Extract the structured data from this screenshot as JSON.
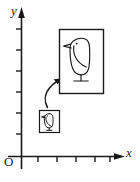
{
  "figure": {
    "background_color": "#ffffff",
    "stroke_color": "#1a1a1a"
  },
  "axes": {
    "y_axis_label": "y",
    "x_axis_label": "x",
    "origin_label": "O",
    "y_tick_count": 6,
    "x_tick_count": 5,
    "has_arrowheads": true
  },
  "objects": {
    "thumbnail": {
      "name": "small framed bird",
      "icon": "bird-icon"
    },
    "enlargement": {
      "name": "large framed bird",
      "icon": "bird-icon"
    },
    "connector": {
      "name": "curved magnify arrow",
      "icon": "curved-arrow-icon"
    }
  }
}
